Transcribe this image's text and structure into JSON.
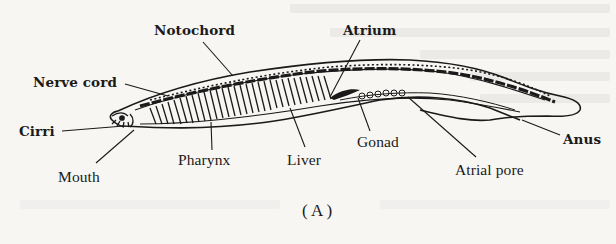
{
  "figure": {
    "caption": "( A )",
    "caption_letter": "A",
    "labels": {
      "notochord": "Notochord",
      "atrium": "Atrium",
      "nerve_cord": "Nerve cord",
      "cirri": "Cirri",
      "mouth": "Mouth",
      "pharynx": "Pharynx",
      "liver": "Liver",
      "gonad": "Gonad",
      "anus": "Anus",
      "atrial_pore": "Atrial pore"
    }
  },
  "colors": {
    "paper": "#f7f6f3",
    "ink": "#1a1a1a",
    "bleed_through": "#e9e7e3"
  }
}
